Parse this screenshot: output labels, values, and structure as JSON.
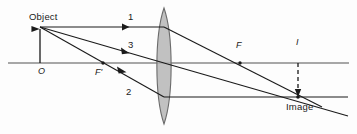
{
  "figure": {
    "type": "optics-ray-diagram",
    "width": 357,
    "height": 134,
    "background_color": "#fdfdfd",
    "line_color": "#1a1a1a",
    "axis_color": "#8a8a8a",
    "lens_fill": "#b0b0b0",
    "lens_stroke": "#6e6e6e"
  },
  "labels": {
    "object": "Object",
    "image": "Image",
    "optical_center": "O",
    "front_focus": "F'",
    "back_focus": "F",
    "image_point": "I",
    "ray_one": "1",
    "ray_two": "2",
    "ray_three": "3"
  },
  "geometry": {
    "optical_axis_y": 63,
    "axis_x_start": 8,
    "axis_x_end": 349,
    "object_base_x": 40,
    "object_tip_y": 27,
    "lens_center_x": 164,
    "lens_top_y": 8,
    "lens_bottom_y": 124,
    "lens_half_width": 9,
    "front_focus_x": 103,
    "back_focus_x": 240,
    "image_x": 298,
    "image_tip_y": 97
  },
  "rays": [
    {
      "name": "ray-1",
      "label": "1",
      "rule": "parallel to axis, refracts through back focus F",
      "incident": {
        "x1": 40,
        "y1": 27,
        "x2": 164,
        "y2": 27
      },
      "refracted": {
        "x1": 164,
        "y1": 27,
        "x2": 320,
        "y2": 106
      },
      "arrow_at": {
        "x": 127,
        "y": 27
      }
    },
    {
      "name": "ray-2",
      "label": "2",
      "rule": "through front focus F', refracts parallel to axis",
      "incident": {
        "x1": 40,
        "y1": 27,
        "x2": 164,
        "y2": 97
      },
      "refracted": {
        "x1": 164,
        "y1": 97,
        "x2": 345,
        "y2": 97
      },
      "arrow_at": {
        "x": 123,
        "y": 74
      }
    },
    {
      "name": "ray-3",
      "label": "3",
      "rule": "through optical center, undeviated",
      "incident": {
        "x1": 40,
        "y1": 27,
        "x2": 164,
        "y2": 63
      },
      "refracted": {
        "x1": 164,
        "y1": 63,
        "x2": 346,
        "y2": 115
      },
      "arrow_at": {
        "x": 126,
        "y": 52
      }
    }
  ],
  "markers": {
    "front_focus_dot": {
      "x": 103,
      "y": 63
    },
    "back_focus_dot": {
      "x": 240,
      "y": 63
    },
    "image_dot": {
      "x": 298,
      "y": 97
    },
    "image_dashed_line": {
      "x": 298,
      "y1": 63,
      "y2": 96
    }
  }
}
